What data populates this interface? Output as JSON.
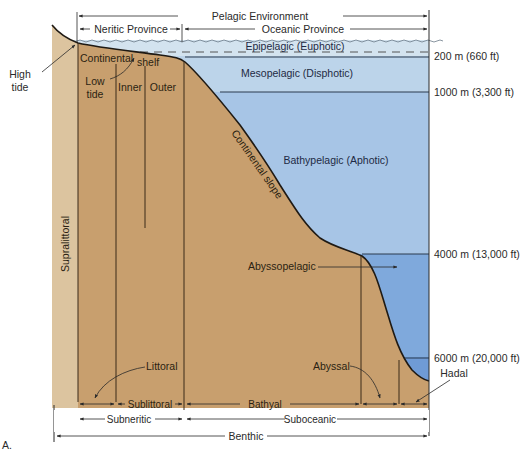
{
  "figure_label": "A.",
  "colors": {
    "land": "#c9a06f",
    "land_light": "#d6b88e",
    "supralittoral": "#dcc39c",
    "water_surface": "#d8e7f1",
    "water_epipelagic": "#cfe0ee",
    "water_mesopelagic": "#b9d2ea",
    "water_bathypelagic": "#a7c5e6",
    "water_abyssopelagic": "#7ea8dc",
    "water_hadal": "#6e9ad6",
    "line": "#1f1a14"
  },
  "top_labels": {
    "pelagic_environment": "Pelagic Environment",
    "neritic_province": "Neritic Province",
    "oceanic_province": "Oceanic Province"
  },
  "left_labels": {
    "high_tide": [
      "High",
      "tide"
    ],
    "low_tide": [
      "Low",
      "tide"
    ],
    "supralittoral": "Supralittoral",
    "continental": "Continental",
    "shelf": "shelf",
    "inner": "Inner",
    "outer": "Outer",
    "continental_slope": "Continental slope",
    "littoral": "Littoral"
  },
  "water_zones": [
    {
      "name": "Epipelagic (Euphotic)"
    },
    {
      "name": "Mesopelagic (Disphotic)"
    },
    {
      "name": "Bathypelagic (Aphotic)"
    },
    {
      "name": "Abyssopelagic"
    }
  ],
  "depth_markers": [
    {
      "label": "200 m (660 ft)"
    },
    {
      "label": "1000 m (3,300 ft)"
    },
    {
      "label": "4000 m (13,000 ft)"
    },
    {
      "label": "6000 m (20,000 ft)"
    }
  ],
  "benthic_labels": {
    "abyssal": "Abyssal",
    "hadal": "Hadal",
    "sublittoral": "Sublittoral",
    "bathyal": "Bathyal",
    "subneritic": "Subneritic",
    "suboceanic": "Suboceanic",
    "benthic": "Benthic"
  }
}
